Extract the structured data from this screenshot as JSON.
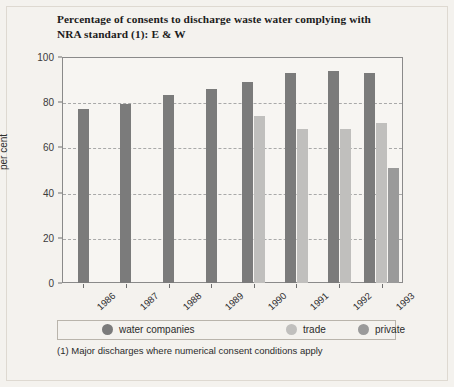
{
  "chart_data": {
    "type": "bar",
    "title": "Percentage of consents to discharge waste water complying with NRA standard (1): E & W",
    "title_line1": "Percentage of consents to discharge waste water complying with",
    "title_line2": "NRA standard (1): E & W",
    "xlabel": "",
    "ylabel": "per cent",
    "ylim": [
      0,
      100
    ],
    "yticks": [
      0,
      20,
      40,
      60,
      80,
      100
    ],
    "ytick_labels": [
      "0",
      "20",
      "40",
      "60",
      "80",
      "100"
    ],
    "grid": true,
    "grid_style": "dashed-horizontal",
    "legend_position": "below-plot",
    "categories": [
      "1986",
      "1987",
      "1988",
      "1989",
      "1990",
      "1991",
      "1992",
      "1993"
    ],
    "series": [
      {
        "name": "water companies",
        "color": "#7b7b7b",
        "values": [
          77,
          79,
          83,
          86,
          89,
          93,
          94,
          93
        ]
      },
      {
        "name": "trade",
        "color": "#c0bfbd",
        "values": [
          null,
          null,
          null,
          null,
          74,
          68,
          68,
          71
        ]
      },
      {
        "name": "private",
        "color": "#9a9a9a",
        "values": [
          null,
          null,
          null,
          null,
          null,
          null,
          null,
          51
        ]
      }
    ],
    "annotations": [
      "(1) Major discharges where numerical consent conditions apply"
    ],
    "footnote": "(1) Major discharges where numerical consent conditions apply"
  },
  "colors": {
    "page_background": "#f4f2ee",
    "plot_background": "#f7f5f2",
    "axis": "#8a8a8a",
    "gridline": "#a9a9a9",
    "text": "#2b2b2b",
    "water_companies": "#7b7b7b",
    "trade": "#c0bfbd",
    "private": "#9a9a9a"
  }
}
